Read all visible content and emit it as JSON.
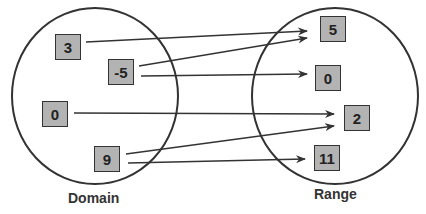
{
  "domain_set": {
    "label": "Domain",
    "elements": [
      {
        "value": "3",
        "x": 55,
        "y": 34
      },
      {
        "value": "-5",
        "x": 108,
        "y": 59
      },
      {
        "value": "0",
        "x": 42,
        "y": 101
      },
      {
        "value": "9",
        "x": 94,
        "y": 146
      }
    ]
  },
  "range_set": {
    "label": "Range",
    "elements": [
      {
        "value": "5",
        "x": 320,
        "y": 16
      },
      {
        "value": "0",
        "x": 315,
        "y": 65
      },
      {
        "value": "2",
        "x": 344,
        "y": 105
      },
      {
        "value": "11",
        "x": 314,
        "y": 145
      }
    ]
  },
  "mappings": [
    {
      "from": "3",
      "to": "5",
      "x1": 86,
      "y1": 42,
      "x2": 307,
      "y2": 31
    },
    {
      "from": "-5",
      "to": "5",
      "x1": 139,
      "y1": 66,
      "x2": 307,
      "y2": 38
    },
    {
      "from": "-5",
      "to": "0",
      "x1": 141,
      "y1": 76,
      "x2": 307,
      "y2": 74
    },
    {
      "from": "0",
      "to": "2",
      "x1": 74,
      "y1": 113,
      "x2": 334,
      "y2": 114
    },
    {
      "from": "9",
      "to": "2",
      "x1": 126,
      "y1": 154,
      "x2": 334,
      "y2": 126
    },
    {
      "from": "9",
      "to": "11",
      "x1": 128,
      "y1": 163,
      "x2": 305,
      "y2": 159
    }
  ],
  "colors": {
    "line": "#333333",
    "box_fill": "#b3b3b3",
    "box_border": "#333333"
  }
}
